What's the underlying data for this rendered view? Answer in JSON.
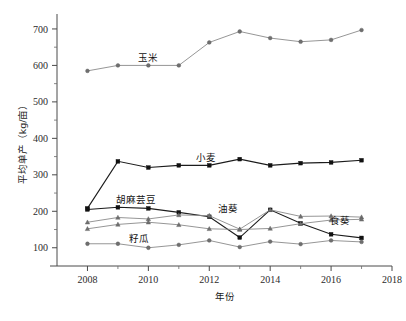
{
  "chart_data": {
    "type": "line",
    "title": "",
    "xlabel": "年份",
    "ylabel": "平均单产（kg/亩）",
    "xlim": [
      2007,
      2018
    ],
    "ylim": [
      50,
      730
    ],
    "grid": false,
    "legend_position": "inline-labels",
    "x": [
      2008,
      2009,
      2010,
      2011,
      2012,
      2013,
      2014,
      2015,
      2016,
      2017
    ],
    "xticks": [
      "2008",
      "2010",
      "2012",
      "2014",
      "2016",
      "2018"
    ],
    "yticks": [
      "100",
      "200",
      "300",
      "400",
      "500",
      "600",
      "700"
    ],
    "series": [
      {
        "name": "玉米",
        "marker": "circle",
        "tone": "light",
        "label_x": 2010.0,
        "label_y": 612,
        "values": [
          585,
          600,
          600,
          600,
          663,
          693,
          675,
          665,
          670,
          697
        ]
      },
      {
        "name": "小麦",
        "marker": "square",
        "tone": "dark",
        "label_x": 2011.9,
        "label_y": 338,
        "values": [
          208,
          337,
          320,
          326,
          326,
          343,
          326,
          332,
          334,
          340
        ]
      },
      {
        "name": "胡麻芸豆",
        "marker": "square",
        "tone": "dark",
        "label_x": 2009.6,
        "label_y": 222,
        "values": [
          205,
          211,
          208,
          197,
          185,
          128,
          204,
          167,
          137,
          127
        ]
      },
      {
        "name": "油葵",
        "marker": "triangle",
        "tone": "light",
        "label_x": 2012.6,
        "label_y": 199,
        "values": [
          170,
          183,
          179,
          190,
          188,
          151,
          204,
          186,
          187,
          184
        ]
      },
      {
        "name": "食葵",
        "marker": "triangle",
        "tone": "light",
        "label_x": 2016.3,
        "label_y": 166,
        "values": [
          152,
          164,
          170,
          163,
          152,
          150,
          153,
          166,
          176,
          178
        ]
      },
      {
        "name": "籽瓜",
        "marker": "circle",
        "tone": "light",
        "label_x": 2009.7,
        "label_y": 115,
        "values": [
          111,
          111,
          100,
          108,
          120,
          102,
          117,
          110,
          120,
          116
        ]
      }
    ]
  },
  "figure": {
    "caption": ""
  }
}
